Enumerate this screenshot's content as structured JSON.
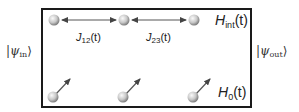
{
  "diagram": {
    "type": "quantum-spin-chain-schematic",
    "input_state": {
      "symbol": "ψ",
      "subscript": "in",
      "label": "|ψ_in⟩"
    },
    "output_state": {
      "symbol": "ψ",
      "subscript": "out",
      "label": "|ψ_out⟩"
    },
    "interaction_hamiltonian": {
      "symbol": "H",
      "subscript": "int",
      "arg": "(t)",
      "label": "H_int(t)"
    },
    "local_hamiltonian": {
      "symbol": "H",
      "subscript": "0",
      "arg": "(t)",
      "label": "H_0(t)"
    },
    "couplings": [
      {
        "symbol": "J",
        "subscript": "12",
        "arg": "(t)",
        "label": "J_12(t)",
        "from": 1,
        "to": 2
      },
      {
        "symbol": "J",
        "subscript": "23",
        "arg": "(t)",
        "label": "J_23(t)",
        "from": 2,
        "to": 3
      }
    ],
    "top_spins": [
      {
        "id": 1,
        "x": 54,
        "y": 20
      },
      {
        "id": 2,
        "x": 124,
        "y": 20
      },
      {
        "id": 3,
        "x": 194,
        "y": 20
      }
    ],
    "bottom_spins": [
      {
        "id": 1,
        "x": 54,
        "y": 96,
        "arrow": "up-right"
      },
      {
        "id": 2,
        "x": 124,
        "y": 96,
        "arrow": "up-right"
      },
      {
        "id": 3,
        "x": 194,
        "y": 96,
        "arrow": "up-right"
      }
    ],
    "colors": {
      "border": "#1a1a1a",
      "arrow": "#444444",
      "sphere_light": "#f2f2f2",
      "sphere_dark": "#7a7a7a"
    }
  }
}
